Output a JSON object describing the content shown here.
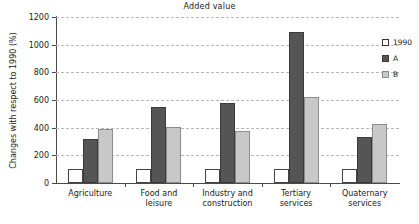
{
  "chart_data": {
    "type": "bar",
    "title": "Added value",
    "xlabel": "",
    "ylabel": "Changes with respect to 1990 (%)",
    "ylim": [
      0,
      1200
    ],
    "ytick_interval": 200,
    "yticks": [
      0,
      200,
      400,
      600,
      800,
      1000,
      1200
    ],
    "grid": true,
    "legend_position": "right",
    "categories": [
      "Agriculture",
      "Food and\nleisure",
      "Industry and\nconstruction",
      "Tertiary\nservices",
      "Quaternary\nservices"
    ],
    "series": [
      {
        "name": "1990",
        "color": "#ffffff",
        "values": [
          100,
          100,
          100,
          100,
          100
        ]
      },
      {
        "name": "A",
        "color": "#555555",
        "values": [
          315,
          550,
          575,
          1090,
          330
        ]
      },
      {
        "name": "B",
        "color": "#c8c8c8",
        "values": [
          390,
          405,
          375,
          625,
          430
        ]
      }
    ]
  },
  "legend": {
    "entries": [
      {
        "label": "1990"
      },
      {
        "label": "A"
      },
      {
        "label": "B"
      }
    ]
  }
}
